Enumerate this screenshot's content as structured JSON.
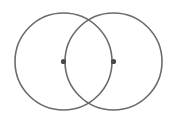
{
  "diagram": {
    "type": "two-intersecting-circles",
    "stroke_color": "#6b6b6b",
    "dot_color": "#4a4a4a",
    "background": "#ffffff",
    "circles": [
      {
        "cx": 63.5,
        "cy": 61.5,
        "r": 48.5
      },
      {
        "cx": 113.5,
        "cy": 61.5,
        "r": 48.5
      }
    ],
    "points": [
      {
        "cx": 63.5,
        "cy": 61.5,
        "r": 2.6
      },
      {
        "cx": 113.5,
        "cy": 61.5,
        "r": 2.6
      }
    ]
  }
}
